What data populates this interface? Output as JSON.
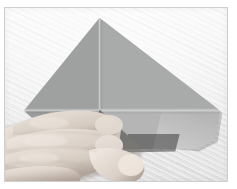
{
  "image": {
    "title": "Origami folding step photograph",
    "caption": "",
    "subject": "hands folding gray origami paper on white cloth",
    "frame": {
      "border_color": "#cfcfcf",
      "border_width_px": 1,
      "x": 4,
      "y": 7,
      "width": 224,
      "height": 175
    },
    "background": {
      "name": "white textured cloth",
      "base_color": "#f4f4f4",
      "weave_color": "#e8e8e8",
      "texture": "diagonal woven stripes rising left-to-right"
    },
    "paper": {
      "name": "origami paper",
      "shape": "kite / diamond with folded center flap",
      "top_left_color": "#9fa0a0",
      "top_right_color": "#a9aaaa",
      "bottom_left_color": "#9b9c9c",
      "bottom_right_color": "#b4b5b4",
      "flap_color": "#6e6f6f",
      "shadow_color": "#5a5a5a",
      "apex_point": "top center",
      "left_point": "left middle",
      "right_point": "right middle"
    },
    "hand": {
      "name": "left hand",
      "description": "four fingers pressing the fold, index finger extended toward the flap",
      "skin_base": "#d8cfc6",
      "skin_shadow": "#a89a90",
      "skin_highlight": "#efe8e0",
      "fingers": 4
    },
    "elements": [
      {
        "label": "paper apex",
        "x": 120,
        "y": 16
      },
      {
        "label": "paper left point",
        "x": 23,
        "y": 108
      },
      {
        "label": "paper right point",
        "x": 218,
        "y": 108
      },
      {
        "label": "center fold",
        "x": 119,
        "y": 108
      },
      {
        "label": "raised flap",
        "x": 140,
        "y": 135
      }
    ]
  }
}
